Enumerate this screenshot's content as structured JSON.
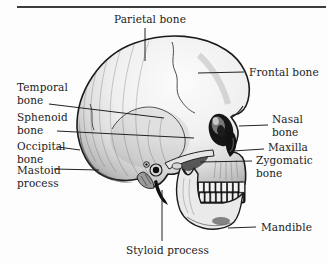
{
  "figure": {
    "labels": {
      "parietal": "Parietal bone",
      "frontal": "Frontal bone",
      "temporal": "Temporal bone",
      "sphenoid": "Sphenoid bone",
      "occipital": "Occipital bone",
      "mastoid": "Mastoid process",
      "nasal": "Nasal bone",
      "maxilla": "Maxilla",
      "zygomatic": "Zygomatic bone",
      "mandible": "Mandible",
      "styloid": "Styloid process"
    }
  },
  "colors": {
    "background": "#fdfdfd",
    "ink": "#1b1b1b",
    "rule": "#3c3c3c",
    "leader": "#222222"
  }
}
